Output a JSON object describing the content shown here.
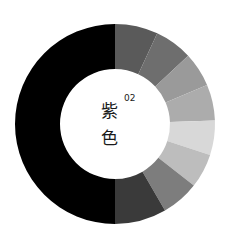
{
  "graphic": {
    "description": "Decorative color-wheel donut: black left half, graded grey segments on right half",
    "center": [
      115,
      124
    ],
    "outer_radius": 100,
    "inner_radius": 55,
    "left_half_color": "#000000",
    "segments": [
      {
        "start_deg": 0,
        "end_deg": 25,
        "color": "#5a5a5a"
      },
      {
        "start_deg": 25,
        "end_deg": 47,
        "color": "#6e6e6e"
      },
      {
        "start_deg": 47,
        "end_deg": 67,
        "color": "#9a9a9a"
      },
      {
        "start_deg": 67,
        "end_deg": 88,
        "color": "#acacac"
      },
      {
        "start_deg": 88,
        "end_deg": 108,
        "color": "#d8d8d8"
      },
      {
        "start_deg": 108,
        "end_deg": 128,
        "color": "#bdbdbd"
      },
      {
        "start_deg": 128,
        "end_deg": 150,
        "color": "#7d7d7d"
      },
      {
        "start_deg": 150,
        "end_deg": 180,
        "color": "#3a3a3a"
      }
    ]
  },
  "label": {
    "char1": "紫",
    "char2": "色",
    "number": "02"
  }
}
